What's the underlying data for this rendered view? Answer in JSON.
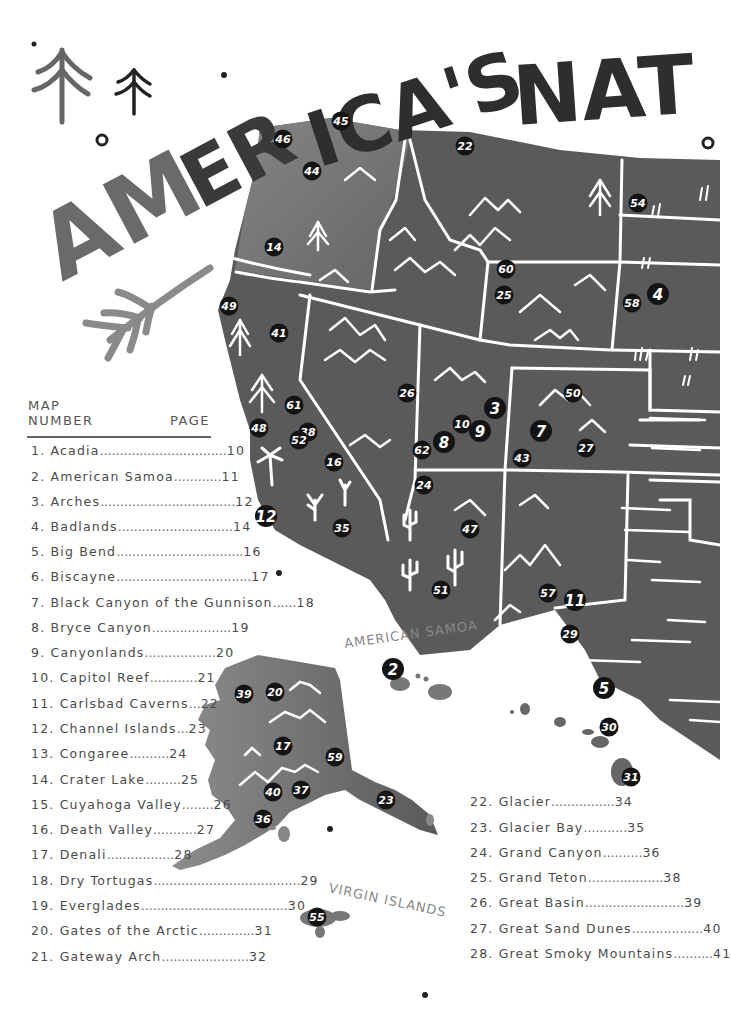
{
  "title": {
    "text": "AMERICA'S NAT",
    "full_visible": [
      "AMER",
      "ICA'S",
      "NAT"
    ]
  },
  "colors": {
    "background": "#ffffff",
    "land_dark": "#555555",
    "land_mid": "#6e6e6e",
    "land_light": "#8a8a8a",
    "state_borders": "#ffffff",
    "marker_fill": "#141414",
    "marker_text": "#ffffff",
    "title_dark": "#2e2e2e",
    "title_gray": "#6a6a6a",
    "legend_text": "#4a4a4a"
  },
  "map": {
    "labels": {
      "american_samoa": "AMERICAN SAMOA",
      "virgin_islands": "VIRGIN ISLANDS"
    },
    "markers": [
      {
        "n": "45",
        "x": 341,
        "y": 121
      },
      {
        "n": "46",
        "x": 283,
        "y": 139
      },
      {
        "n": "44",
        "x": 312,
        "y": 171
      },
      {
        "n": "22",
        "x": 465,
        "y": 146
      },
      {
        "n": "54",
        "x": 638,
        "y": 203
      },
      {
        "n": "14",
        "x": 274,
        "y": 247
      },
      {
        "n": "60",
        "x": 506,
        "y": 269
      },
      {
        "n": "25",
        "x": 504,
        "y": 295
      },
      {
        "n": "58",
        "x": 632,
        "y": 303
      },
      {
        "n": "4",
        "x": 658,
        "y": 294,
        "big": true
      },
      {
        "n": "49",
        "x": 229,
        "y": 306
      },
      {
        "n": "41",
        "x": 279,
        "y": 333
      },
      {
        "n": "26",
        "x": 407,
        "y": 393
      },
      {
        "n": "50",
        "x": 573,
        "y": 393
      },
      {
        "n": "3",
        "x": 495,
        "y": 408,
        "big": true
      },
      {
        "n": "61",
        "x": 294,
        "y": 405
      },
      {
        "n": "10",
        "x": 462,
        "y": 424
      },
      {
        "n": "9",
        "x": 480,
        "y": 431,
        "big": true
      },
      {
        "n": "7",
        "x": 541,
        "y": 431,
        "big": true
      },
      {
        "n": "48",
        "x": 259,
        "y": 428
      },
      {
        "n": "38",
        "x": 308,
        "y": 432
      },
      {
        "n": "52",
        "x": 299,
        "y": 440
      },
      {
        "n": "8",
        "x": 444,
        "y": 442,
        "big": true
      },
      {
        "n": "62",
        "x": 422,
        "y": 450
      },
      {
        "n": "27",
        "x": 586,
        "y": 448
      },
      {
        "n": "43",
        "x": 522,
        "y": 458
      },
      {
        "n": "16",
        "x": 334,
        "y": 462
      },
      {
        "n": "24",
        "x": 424,
        "y": 485
      },
      {
        "n": "12",
        "x": 266,
        "y": 516,
        "big": true
      },
      {
        "n": "35",
        "x": 342,
        "y": 528
      },
      {
        "n": "47",
        "x": 470,
        "y": 529
      },
      {
        "n": "51",
        "x": 441,
        "y": 590
      },
      {
        "n": "57",
        "x": 548,
        "y": 593
      },
      {
        "n": "11",
        "x": 575,
        "y": 600,
        "big": true
      },
      {
        "n": "29",
        "x": 570,
        "y": 634
      },
      {
        "n": "2",
        "x": 393,
        "y": 669,
        "big": true
      },
      {
        "n": "5",
        "x": 604,
        "y": 688,
        "big": true
      },
      {
        "n": "39",
        "x": 244,
        "y": 694
      },
      {
        "n": "20",
        "x": 275,
        "y": 692
      },
      {
        "n": "30",
        "x": 609,
        "y": 727
      },
      {
        "n": "17",
        "x": 283,
        "y": 746
      },
      {
        "n": "59",
        "x": 335,
        "y": 757
      },
      {
        "n": "31",
        "x": 631,
        "y": 777
      },
      {
        "n": "40",
        "x": 273,
        "y": 792
      },
      {
        "n": "37",
        "x": 301,
        "y": 790
      },
      {
        "n": "23",
        "x": 386,
        "y": 800
      },
      {
        "n": "36",
        "x": 263,
        "y": 819
      },
      {
        "n": "55",
        "x": 317,
        "y": 917
      }
    ]
  },
  "legend": {
    "header_left": [
      "MAP",
      "NUMBER"
    ],
    "header_right": "PAGE",
    "column1": [
      {
        "num": "1.",
        "name": "Acadia",
        "dots": "................................",
        "page": "10",
        "y": 452
      },
      {
        "num": "2.",
        "name": "American Samoa",
        "dots": "............",
        "page": "11",
        "y": 478
      },
      {
        "num": "3.",
        "name": "Arches",
        "dots": "..................................",
        "page": "12",
        "y": 503
      },
      {
        "num": "4.",
        "name": "Badlands",
        "dots": ".............................",
        "page": "14",
        "y": 528
      },
      {
        "num": "5.",
        "name": "Big Bend",
        "dots": "................................",
        "page": "16",
        "y": 553
      },
      {
        "num": "6.",
        "name": "Biscayne",
        "dots": "..................................",
        "page": "17",
        "y": 578
      },
      {
        "num": "7.",
        "name": "Black Canyon of the Gunnison",
        "dots": "......",
        "page": "18",
        "y": 604
      },
      {
        "num": "8.",
        "name": "Bryce Canyon",
        "dots": "....................",
        "page": "19",
        "y": 629
      },
      {
        "num": "9.",
        "name": "Canyonlands",
        "dots": "..................",
        "page": "20",
        "y": 654
      },
      {
        "num": "10.",
        "name": "Capitol Reef",
        "dots": "............",
        "page": "21",
        "y": 679
      },
      {
        "num": "11.",
        "name": "Carlsbad Caverns",
        "dots": "...",
        "page": "22",
        "y": 705
      },
      {
        "num": "12.",
        "name": "Channel Islands",
        "dots": "...",
        "page": "23",
        "y": 730
      },
      {
        "num": "13.",
        "name": "Congaree",
        "dots": "..........",
        "page": "24",
        "y": 755
      },
      {
        "num": "14.",
        "name": "Crater Lake",
        "dots": ".........",
        "page": "25",
        "y": 781
      },
      {
        "num": "15.",
        "name": "Cuyahoga Valley",
        "dots": "........",
        "page": "26",
        "y": 806
      },
      {
        "num": "16.",
        "name": "Death Valley",
        "dots": "...........",
        "page": "27",
        "y": 831
      },
      {
        "num": "17.",
        "name": "Denali",
        "dots": ".................",
        "page": "28",
        "y": 856
      },
      {
        "num": "18.",
        "name": "Dry Tortugas",
        "dots": ".....................................",
        "page": "29",
        "y": 882
      },
      {
        "num": "19.",
        "name": "Everglades",
        "dots": ".....................................",
        "page": "30",
        "y": 907
      },
      {
        "num": "20.",
        "name": "Gates of the Arctic",
        "dots": "..............",
        "page": "31",
        "y": 932
      },
      {
        "num": "21.",
        "name": "Gateway Arch",
        "dots": "......................",
        "page": "32",
        "y": 958
      }
    ],
    "column2": [
      {
        "num": "22.",
        "name": "Glacier",
        "dots": "................",
        "page": "34",
        "y": 803
      },
      {
        "num": "23.",
        "name": "Glacier Bay",
        "dots": "...........",
        "page": "35",
        "y": 829
      },
      {
        "num": "24.",
        "name": "Grand Canyon",
        "dots": "..........",
        "page": "36",
        "y": 854
      },
      {
        "num": "25.",
        "name": "Grand Teton",
        "dots": "...................",
        "page": "38",
        "y": 879
      },
      {
        "num": "26.",
        "name": "Great Basin",
        "dots": ".........................",
        "page": "39",
        "y": 904
      },
      {
        "num": "27.",
        "name": "Great Sand Dunes",
        "dots": "..................",
        "page": "40",
        "y": 930
      },
      {
        "num": "28.",
        "name": "Great Smoky Mountains",
        "dots": "..........",
        "page": "41",
        "y": 955
      }
    ]
  }
}
